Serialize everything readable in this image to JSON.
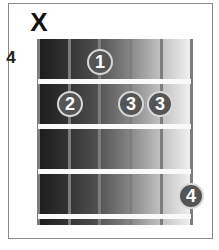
{
  "chord": {
    "muted_marker": "X",
    "start_fret": "4",
    "strings": 6,
    "frets": 4,
    "fingers": [
      {
        "finger": "1",
        "string": 3,
        "fret": 1
      },
      {
        "finger": "2",
        "string": 2,
        "fret": 2
      },
      {
        "finger": "3",
        "string": 4,
        "fret": 2
      },
      {
        "finger": "3",
        "string": 5,
        "fret": 2
      },
      {
        "finger": "4",
        "string": 6,
        "fret": 4
      }
    ]
  },
  "colors": {
    "dot": "#555555",
    "dot_ring": "#d8d8d8",
    "fret_line": "#fafafa",
    "string": "#7d7d7d"
  }
}
